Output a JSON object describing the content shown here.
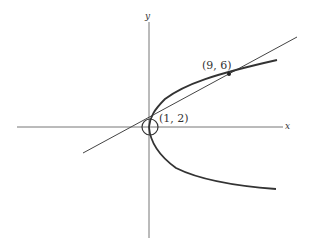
{
  "figure": {
    "axes": {
      "x_label": "x",
      "y_label": "y"
    },
    "curves": [
      {
        "name": "parabola",
        "description": "parabola opening right, vertex near origin"
      },
      {
        "name": "tangent-line",
        "description": "straight line through (1, 2) and (9, 6)"
      }
    ],
    "points": [
      {
        "label": "(9, 6)",
        "marker": "filled-dot"
      },
      {
        "label": "(1, 2)",
        "marker": "circle"
      }
    ],
    "colors": {
      "stroke": "#333333",
      "axis": "#666666",
      "background": "#ffffff"
    }
  }
}
